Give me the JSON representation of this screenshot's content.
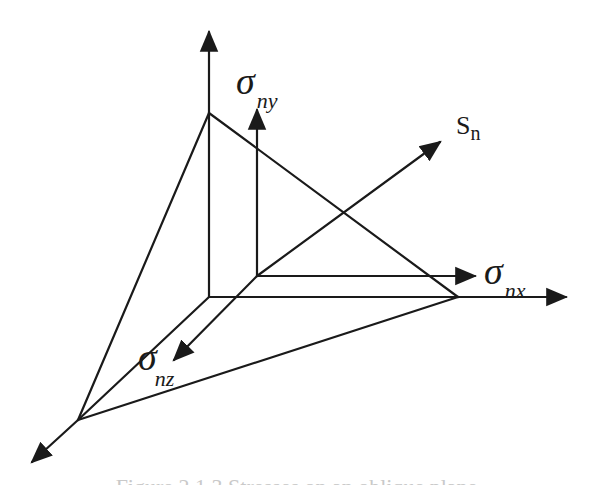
{
  "diagram": {
    "type": "3d-stress-tetrahedron",
    "stroke_color": "#1a1a1a",
    "labels": {
      "sigma_ny": {
        "symbol": "σ",
        "subscript": "ny"
      },
      "sigma_nx": {
        "symbol": "σ",
        "subscript": "nx"
      },
      "sigma_nz": {
        "symbol": "σ",
        "subscript": "nz"
      },
      "s_n": {
        "symbol": "S",
        "subscript": "n"
      }
    },
    "axes": [
      "y-axis (vertical)",
      "x-axis (horizontal)",
      "z-axis (diagonal toward viewer)"
    ],
    "vectors": [
      "σny",
      "σnx",
      "σnz",
      "Sn"
    ]
  },
  "caption": {
    "text": "Figure 2.1.3 Stresses on an oblique plane",
    "note": "caption partially cropped at bottom edge"
  }
}
